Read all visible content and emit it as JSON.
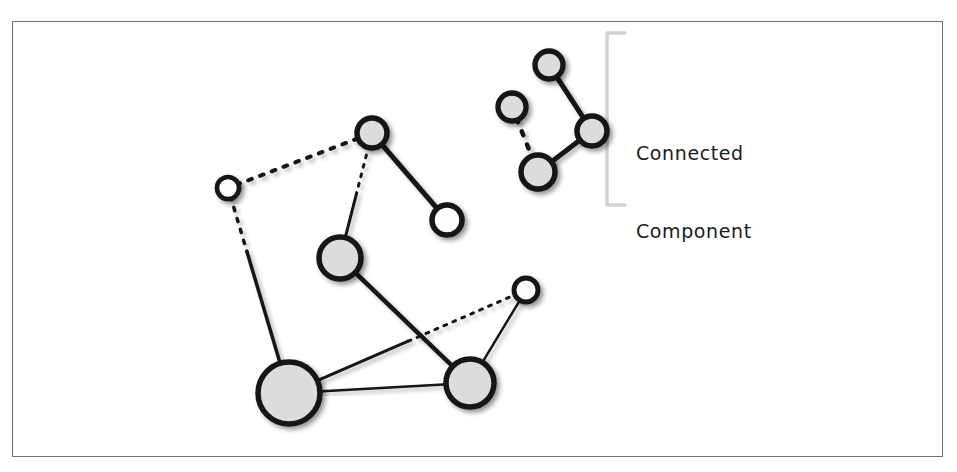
{
  "figure": {
    "title_cut_top": "",
    "caption_cut_bottom": "",
    "annotation": {
      "line1": "Connected",
      "line2": "Component",
      "full": "Connected Component",
      "name": "connected-component-label"
    },
    "frame": {
      "x": 12,
      "y": 21,
      "width": 931,
      "height": 436,
      "stroke": "#6f7276"
    },
    "colors": {
      "node_fill_gray": "#dcdcdc",
      "node_fill_white": "#fefefe",
      "node_stroke": "#141414",
      "edge_stroke": "#141414",
      "bracket_stroke": "#d2d2d2",
      "shadow": "#b9b9b9",
      "background": "#ffffff",
      "text": "#1c1c1c"
    },
    "bracket": {
      "x": 607,
      "y_top": 33,
      "y_bottom": 205,
      "arm": 18
    }
  },
  "graph": {
    "type": "node-link-diagram",
    "node_count": 11,
    "edge_count": 11,
    "component_count": 2,
    "components": [
      {
        "id": "main",
        "label": "",
        "node_ids": [
          "n1",
          "n2",
          "n3",
          "n4",
          "n5",
          "n6",
          "n7"
        ]
      },
      {
        "id": "cc",
        "label": "Connected Component",
        "node_ids": [
          "c1",
          "c2",
          "c3",
          "c4"
        ]
      }
    ],
    "nodes": [
      {
        "id": "n1",
        "cx": 228,
        "cy": 188,
        "r": 11,
        "fill": "white",
        "component": "main"
      },
      {
        "id": "n2",
        "cx": 372,
        "cy": 133,
        "r": 15,
        "fill": "gray",
        "component": "main"
      },
      {
        "id": "n3",
        "cx": 447,
        "cy": 220,
        "r": 15,
        "fill": "white",
        "component": "main"
      },
      {
        "id": "n4",
        "cx": 340,
        "cy": 258,
        "r": 21,
        "fill": "gray",
        "component": "main"
      },
      {
        "id": "n5",
        "cx": 289,
        "cy": 393,
        "r": 31,
        "fill": "gray",
        "component": "main"
      },
      {
        "id": "n6",
        "cx": 470,
        "cy": 383,
        "r": 24,
        "fill": "gray",
        "component": "main"
      },
      {
        "id": "n7",
        "cx": 526,
        "cy": 290,
        "r": 12,
        "fill": "white",
        "component": "main"
      },
      {
        "id": "c1",
        "cx": 549,
        "cy": 65,
        "r": 14,
        "fill": "gray",
        "component": "cc"
      },
      {
        "id": "c2",
        "cx": 512,
        "cy": 107,
        "r": 14,
        "fill": "gray",
        "component": "cc"
      },
      {
        "id": "c3",
        "cx": 592,
        "cy": 131,
        "r": 15,
        "fill": "gray",
        "component": "cc"
      },
      {
        "id": "c4",
        "cx": 538,
        "cy": 172,
        "r": 17,
        "fill": "gray",
        "component": "cc"
      }
    ],
    "edges": [
      {
        "source": "n1",
        "target": "n2",
        "style": "dotted",
        "width": 4
      },
      {
        "source": "n2",
        "target": "n3",
        "style": "solid",
        "width": 5
      },
      {
        "source": "n2",
        "target": "n4",
        "style": "mixed",
        "width": 3,
        "dash_from": "source",
        "split": 0.5
      },
      {
        "source": "n1",
        "target": "n5",
        "style": "mixed",
        "width": 3.5,
        "dash_from": "source",
        "split": 0.33
      },
      {
        "source": "n4",
        "target": "n6",
        "style": "solid",
        "width": 4.5
      },
      {
        "source": "n5",
        "target": "n7",
        "style": "mixed",
        "width": 3,
        "dash_from": "target",
        "split": 0.46
      },
      {
        "source": "n5",
        "target": "n6",
        "style": "solid",
        "width": 2.5
      },
      {
        "source": "n7",
        "target": "n6",
        "style": "solid",
        "width": 2.5
      },
      {
        "source": "c1",
        "target": "c3",
        "style": "solid",
        "width": 5
      },
      {
        "source": "c3",
        "target": "c4",
        "style": "solid",
        "width": 5
      },
      {
        "source": "c2",
        "target": "c4",
        "style": "dotted",
        "width": 4.5
      }
    ]
  }
}
